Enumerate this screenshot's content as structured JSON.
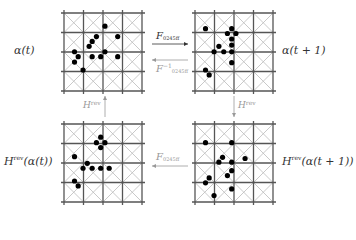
{
  "diagram": {
    "grid_size": 4,
    "line_color": "#555555",
    "diag_color": "#bbbbbb",
    "dot_color": "#000000",
    "panels": [
      {
        "id": "alpha-t",
        "label_main": "α(t)",
        "x": 64,
        "y": 13,
        "cell": 19.5,
        "label_pos": "left",
        "dots": [
          [
            0.64,
            0.25
          ],
          [
            0.5,
            0.42
          ],
          [
            0.43,
            0.5
          ],
          [
            0.38,
            0.58
          ],
          [
            0.14,
            0.67
          ],
          [
            0.2,
            0.75
          ],
          [
            0.14,
            0.84
          ],
          [
            0.43,
            0.75
          ],
          [
            0.57,
            0.75
          ],
          [
            0.64,
            0.67
          ],
          [
            0.85,
            0.42
          ],
          [
            0.85,
            0.75
          ],
          [
            0.28,
            0.97
          ]
        ]
      },
      {
        "id": "alpha-t1",
        "label_main": "α(t + 1)",
        "x": 195,
        "y": 13,
        "cell": 19.5,
        "label_pos": "right",
        "dots": [
          [
            0.14,
            0.29
          ],
          [
            0.57,
            0.29
          ],
          [
            0.5,
            0.37
          ],
          [
            0.64,
            0.37
          ],
          [
            0.57,
            0.46
          ],
          [
            0.57,
            0.56
          ],
          [
            0.57,
            0.67
          ],
          [
            0.36,
            0.58
          ],
          [
            0.28,
            0.67
          ],
          [
            0.44,
            0.67
          ],
          [
            0.57,
            0.85
          ],
          [
            0.14,
            0.97
          ],
          [
            0.2,
            1.05
          ]
        ]
      },
      {
        "id": "hrev-alpha-t",
        "label_main": "H",
        "label_sup": "rev",
        "label_rest": "(α(t))",
        "x": 64,
        "y": 124,
        "cell": 19.5,
        "label_pos": "left",
        "dots": [
          [
            0.14,
            0.57
          ],
          [
            0.57,
            0.25
          ],
          [
            0.5,
            0.34
          ],
          [
            0.64,
            0.34
          ],
          [
            0.57,
            0.42
          ],
          [
            0.35,
            0.68
          ],
          [
            0.28,
            0.76
          ],
          [
            0.43,
            0.76
          ],
          [
            0.57,
            0.76
          ],
          [
            0.71,
            0.76
          ],
          [
            0.14,
            0.97
          ],
          [
            0.2,
            1.05
          ]
        ]
      },
      {
        "id": "hrev-alpha-t1",
        "label_main": "H",
        "label_sup": "rev",
        "label_rest": "(α(t + 1))",
        "x": 195,
        "y": 124,
        "cell": 19.5,
        "label_pos": "right",
        "dots": [
          [
            0.14,
            0.34
          ],
          [
            0.57,
            0.34
          ],
          [
            0.42,
            0.58
          ],
          [
            0.36,
            0.66
          ],
          [
            0.57,
            0.66
          ],
          [
            0.79,
            0.6
          ],
          [
            0.57,
            0.8
          ],
          [
            0.5,
            0.88
          ],
          [
            0.2,
            0.92
          ],
          [
            0.14,
            1.0
          ],
          [
            0.57,
            1.1
          ],
          [
            0.28,
            1.21
          ]
        ]
      }
    ],
    "arrows": [
      {
        "id": "forward",
        "label": "F",
        "label_sub": "0245ff",
        "dir": "right",
        "x1": 152,
        "x2": 188,
        "y": 44,
        "faint": false
      },
      {
        "id": "inverse",
        "label": "F",
        "label_sup": "−1",
        "label_sub": "0245ff",
        "dir": "left",
        "x1": 152,
        "x2": 188,
        "y": 60,
        "faint": true
      },
      {
        "id": "hrev-up",
        "label": "H",
        "label_sup": "rev",
        "dir": "up",
        "x": 105,
        "y1": 117,
        "y2": 96,
        "faint": true
      },
      {
        "id": "hrev-down",
        "label": "H",
        "label_sup": "rev",
        "dir": "down",
        "x": 234,
        "y1": 96,
        "y2": 117,
        "faint": true
      },
      {
        "id": "bottom",
        "label": "F",
        "label_sub": "0245ff",
        "dir": "left",
        "x1": 152,
        "x2": 188,
        "y": 166,
        "faint": true
      }
    ]
  },
  "labels": {
    "alpha_t": "α(t)",
    "alpha_t1": "α(t + 1)",
    "H": "H",
    "rev": "rev",
    "hrev_t_rest": "(α(t))",
    "hrev_t1_rest": "(α(t + 1))",
    "F": "F",
    "F_sub": "0245ff",
    "F_inv_sup": "−1"
  }
}
